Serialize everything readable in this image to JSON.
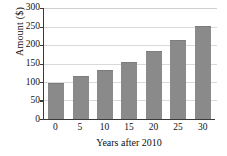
{
  "chart_data": {
    "type": "bar",
    "title": "",
    "xlabel": "Years after 2010",
    "ylabel": "Amount ($)",
    "categories": [
      "0",
      "5",
      "10",
      "15",
      "20",
      "25",
      "30"
    ],
    "values": [
      98,
      115,
      133,
      155,
      183,
      214,
      252
    ],
    "ylim": [
      0,
      300
    ],
    "yticks": [
      "0",
      "50",
      "100",
      "150",
      "200",
      "250",
      "300"
    ],
    "ytick_values": [
      0,
      50,
      100,
      150,
      200,
      250,
      300
    ],
    "xticks": [
      "0",
      "5",
      "10",
      "15",
      "20",
      "25",
      "30"
    ],
    "grid": true,
    "legend": "none",
    "bar_color": "#8a8a8a",
    "axis_color": "#3a3a3a",
    "grid_color": "#d9d9d9",
    "background": "#ffffff"
  }
}
